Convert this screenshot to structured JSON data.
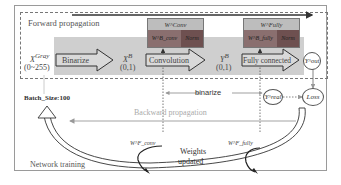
{
  "diagram": {
    "sections": {
      "forward": "Forward propagation",
      "backward": "Backward propagation",
      "training": "Network training"
    },
    "input": {
      "symbol": "X",
      "superscript": "Gray",
      "range": "(0~255)"
    },
    "binarize_arrow": "Binarize",
    "xb": {
      "symbol": "X",
      "superscript": "B",
      "range": "(0,1)"
    },
    "conv_arrow": "Convolution",
    "yb": {
      "symbol": "Y",
      "superscript": "B",
      "range": "(0,1)"
    },
    "fc_arrow": "Fully connected",
    "w_conv": {
      "top": "W^Conv",
      "left": "W^B_conv",
      "right": "Norm"
    },
    "w_fully": {
      "top": "W^Fully",
      "left": "W^B_fully",
      "right": "Norm"
    },
    "y_out": "Y^out",
    "y_real": "Y^real",
    "loss": "Loss",
    "binarize_label": "binarize",
    "batch_size": "Batch_Size:100",
    "wf_conv": "W^F_conv",
    "wf_fully": "W^F_fully",
    "weights_updated_1": "Weights",
    "weights_updated_2": "updated",
    "colors": {
      "band": "#cfcfcf",
      "weight_top": "#bdbdbd",
      "weight_left": "#8a6f6f",
      "weight_right": "#6e5050"
    }
  }
}
